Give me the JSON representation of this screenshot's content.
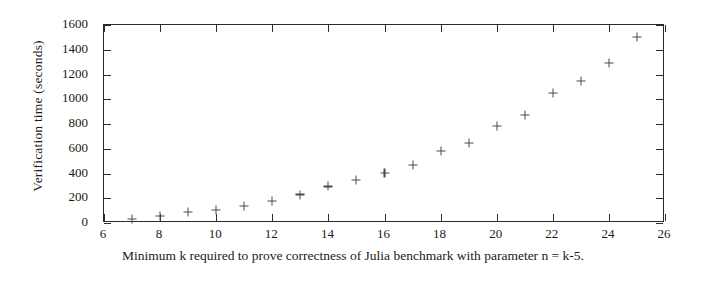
{
  "chart_data": {
    "type": "scatter",
    "title": "",
    "subtitle": "",
    "xlabel": "Minimum k required to prove correctness of Julia benchmark with parameter n = k-5.",
    "ylabel": "Verification time (seconds)",
    "xlim": [
      6,
      26
    ],
    "ylim": [
      0,
      1600
    ],
    "xticks": [
      6,
      8,
      10,
      12,
      14,
      16,
      18,
      20,
      22,
      24,
      26
    ],
    "yticks": [
      0,
      200,
      400,
      600,
      800,
      1000,
      1200,
      1400,
      1600
    ],
    "xtick_labels": [
      "6",
      "8",
      "10",
      "12",
      "14",
      "16",
      "18",
      "20",
      "22",
      "24",
      "26"
    ],
    "ytick_labels": [
      "0",
      "200",
      "400",
      "600",
      "800",
      "1000",
      "1200",
      "1400",
      "1600"
    ],
    "xtick_step": 2,
    "ytick_step": 200,
    "grid": false,
    "legend": false,
    "legend_position": "none",
    "marker": "plus",
    "marker_color": "#4a4a4a",
    "axis_color": "#2b2b2b",
    "background_color": "#ffffff",
    "x": [
      7,
      8,
      9,
      10,
      11,
      12,
      13,
      14,
      15,
      16,
      17,
      18,
      19,
      20,
      21,
      22,
      23,
      24,
      25
    ],
    "y": [
      30,
      55,
      90,
      105,
      140,
      180,
      230,
      295,
      350,
      405,
      470,
      580,
      645,
      785,
      875,
      1050,
      1150,
      1295,
      1505
    ],
    "series": [
      {
        "name": "verification time",
        "values": [
          30,
          55,
          90,
          105,
          140,
          180,
          230,
          295,
          350,
          405,
          470,
          580,
          645,
          785,
          875,
          1050,
          1150,
          1295,
          1505
        ]
      }
    ],
    "points": [
      {
        "k": 7,
        "seconds": 30
      },
      {
        "k": 8,
        "seconds": 55
      },
      {
        "k": 9,
        "seconds": 90
      },
      {
        "k": 10,
        "seconds": 105
      },
      {
        "k": 11,
        "seconds": 140
      },
      {
        "k": 12,
        "seconds": 180
      },
      {
        "k": 13,
        "seconds": 230
      },
      {
        "k": 14,
        "seconds": 295
      },
      {
        "k": 15,
        "seconds": 350
      },
      {
        "k": 16,
        "seconds": 405
      },
      {
        "k": 17,
        "seconds": 470
      },
      {
        "k": 18,
        "seconds": 580
      },
      {
        "k": 19,
        "seconds": 645
      },
      {
        "k": 20,
        "seconds": 785
      },
      {
        "k": 21,
        "seconds": 875
      },
      {
        "k": 22,
        "seconds": 1050
      },
      {
        "k": 23,
        "seconds": 1150
      },
      {
        "k": 24,
        "seconds": 1295
      },
      {
        "k": 25,
        "seconds": 1505
      }
    ]
  },
  "caption": {
    "text": "Minimum k required to prove correctness of Julia benchmark with parameter n = k-5."
  },
  "axes": {
    "y_title": "Verification time (seconds)"
  }
}
